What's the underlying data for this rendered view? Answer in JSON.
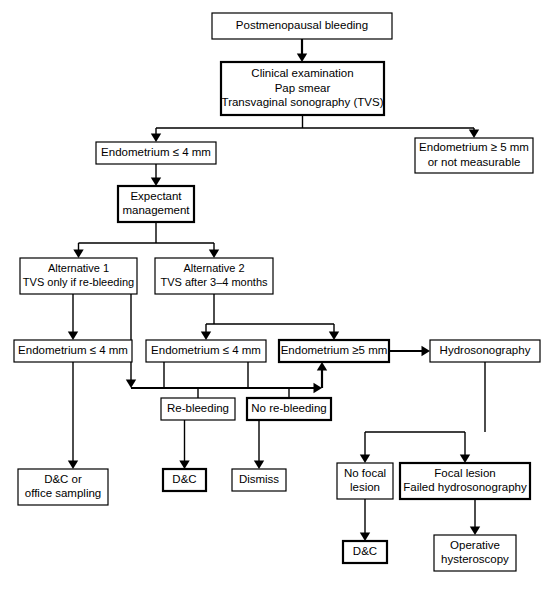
{
  "diagram": {
    "background_color": "#ffffff",
    "line_color": "#000000",
    "text_color": "#000000",
    "nodes": [
      {
        "id": "n1",
        "label_lines": [
          "Postmenopausal bleeding"
        ],
        "x": 212,
        "y": 13,
        "w": 180,
        "h": 26,
        "weight": "thin",
        "font": 11.5
      },
      {
        "id": "n2",
        "label_lines": [
          "Clinical examination",
          "Pap smear",
          "Transvaginal sonography (TVS)"
        ],
        "x": 221,
        "y": 62,
        "w": 163,
        "h": 53,
        "weight": "thick",
        "font": 11.5
      },
      {
        "id": "n3",
        "label_lines": [
          "Endometrium ≤ 4 mm"
        ],
        "x": 96,
        "y": 142,
        "w": 120,
        "h": 22,
        "weight": "thin",
        "font": 11.5
      },
      {
        "id": "n4",
        "label_lines": [
          "Endometrium ≥ 5 mm",
          "or not measurable"
        ],
        "x": 415,
        "y": 138,
        "w": 118,
        "h": 35,
        "weight": "thin",
        "font": 11.5
      },
      {
        "id": "n5",
        "label_lines": [
          "Expectant",
          "management"
        ],
        "x": 118,
        "y": 186,
        "w": 76,
        "h": 36,
        "weight": "thick",
        "font": 11.5
      },
      {
        "id": "n6",
        "label_lines": [
          "Alternative 1",
          "TVS only if re-bleeding"
        ],
        "x": 20,
        "y": 258,
        "w": 117,
        "h": 36,
        "weight": "thin",
        "font": 11
      },
      {
        "id": "n7",
        "label_lines": [
          "Alternative 2",
          "TVS after 3–4 months"
        ],
        "x": 155,
        "y": 258,
        "w": 118,
        "h": 36,
        "weight": "thin",
        "font": 11
      },
      {
        "id": "n8",
        "label_lines": [
          "Endometrium ≤ 4 mm"
        ],
        "x": 14,
        "y": 340,
        "w": 118,
        "h": 22,
        "weight": "thin",
        "font": 11.5
      },
      {
        "id": "n9",
        "label_lines": [
          "Endometrium ≤ 4 mm"
        ],
        "x": 146,
        "y": 340,
        "w": 120,
        "h": 22,
        "weight": "thin",
        "font": 11.5
      },
      {
        "id": "n10",
        "label_lines": [
          "Endometrium ≥5 mm"
        ],
        "x": 279,
        "y": 340,
        "w": 110,
        "h": 22,
        "weight": "thick",
        "font": 11.5
      },
      {
        "id": "n11",
        "label_lines": [
          "Hydrosonography"
        ],
        "x": 430,
        "y": 340,
        "w": 110,
        "h": 22,
        "weight": "thin",
        "font": 11.5
      },
      {
        "id": "n12",
        "label_lines": [
          "Re-bleeding"
        ],
        "x": 161,
        "y": 398,
        "w": 74,
        "h": 22,
        "weight": "thin",
        "font": 11.5
      },
      {
        "id": "n13",
        "label_lines": [
          "No re-bleeding"
        ],
        "x": 247,
        "y": 398,
        "w": 84,
        "h": 22,
        "weight": "thick",
        "font": 11.5
      },
      {
        "id": "n14",
        "label_lines": [
          "D&C or",
          "office sampling"
        ],
        "x": 18,
        "y": 469,
        "w": 90,
        "h": 36,
        "weight": "thin",
        "font": 11.5
      },
      {
        "id": "n15",
        "label_lines": [
          "D&C"
        ],
        "x": 163,
        "y": 469,
        "w": 43,
        "h": 22,
        "weight": "thick",
        "font": 11.5
      },
      {
        "id": "n16",
        "label_lines": [
          "Dismiss"
        ],
        "x": 232,
        "y": 469,
        "w": 54,
        "h": 22,
        "weight": "thin",
        "font": 11.5
      },
      {
        "id": "n17",
        "label_lines": [
          "No focal",
          "lesion"
        ],
        "x": 337,
        "y": 463,
        "w": 56,
        "h": 36,
        "weight": "thin",
        "font": 11.5
      },
      {
        "id": "n18",
        "label_lines": [
          "Focal lesion",
          "Failed hydrosonography"
        ],
        "x": 400,
        "y": 463,
        "w": 130,
        "h": 36,
        "weight": "thick",
        "font": 11.5
      },
      {
        "id": "n19",
        "label_lines": [
          "D&C"
        ],
        "x": 343,
        "y": 541,
        "w": 44,
        "h": 22,
        "weight": "thick",
        "font": 11.5
      },
      {
        "id": "n20",
        "label_lines": [
          "Operative",
          "hysteroscopy"
        ],
        "x": 434,
        "y": 535,
        "w": 82,
        "h": 36,
        "weight": "thin",
        "font": 11.5
      }
    ],
    "connector_count": 24
  }
}
